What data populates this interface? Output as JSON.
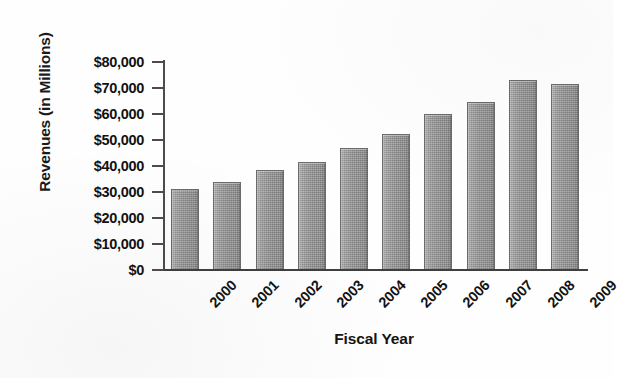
{
  "chart_data": {
    "type": "bar",
    "title": "",
    "subtitle": "",
    "xlabel": "Fiscal Year",
    "ylabel": "Revenues (in Millions)",
    "categories": [
      "2000",
      "2001",
      "2002",
      "2003",
      "2004",
      "2005",
      "2006",
      "2007",
      "2008",
      "2009"
    ],
    "values": [
      31000,
      34000,
      38500,
      41500,
      47000,
      52500,
      60000,
      64500,
      73000,
      71500
    ],
    "series": [
      {
        "name": "Revenues",
        "values": [
          31000,
          34000,
          38500,
          41500,
          47000,
          52500,
          60000,
          64500,
          73000,
          71500
        ]
      }
    ],
    "ylim": [
      0,
      80000
    ],
    "ytick_values": [
      0,
      10000,
      20000,
      30000,
      40000,
      50000,
      60000,
      70000,
      80000
    ],
    "ytick_labels": [
      "$0",
      "$10,000",
      "$20,000",
      "$30,000",
      "$40,000",
      "$50,000",
      "$60,000",
      "$70,000",
      "$80,000"
    ],
    "grid": false,
    "legend": false,
    "legend_position": "none",
    "bar_color": "#8d8d8d",
    "bar_edge_color": "#6b6b6b",
    "axis_color": "#4c4c4c",
    "background_color": "#ffffff",
    "text_color": "#111111",
    "xtick_rotation": -45
  },
  "axes": {
    "y_title": "Revenues (in Millions)",
    "x_title": "Fiscal Year"
  }
}
